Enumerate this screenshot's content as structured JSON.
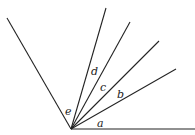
{
  "diagram": {
    "type": "angles-at-a-point",
    "vertex": {
      "x": 71,
      "y": 129
    },
    "rays": [
      {
        "id": "ray-horizontal",
        "x2": 195,
        "y2": 129
      },
      {
        "id": "ray-1",
        "x2": 176,
        "y2": 69
      },
      {
        "id": "ray-2",
        "x2": 159,
        "y2": 41
      },
      {
        "id": "ray-3",
        "x2": 130,
        "y2": 22
      },
      {
        "id": "ray-4",
        "x2": 106,
        "y2": 8
      },
      {
        "id": "ray-left",
        "x2": 7,
        "y2": 18
      }
    ],
    "labels": [
      {
        "text": "a",
        "x": 97,
        "y": 127
      },
      {
        "text": "b",
        "x": 117,
        "y": 98
      },
      {
        "text": "c",
        "x": 100,
        "y": 91
      },
      {
        "text": "d",
        "x": 91,
        "y": 75
      },
      {
        "text": "e",
        "x": 65,
        "y": 115
      }
    ]
  }
}
